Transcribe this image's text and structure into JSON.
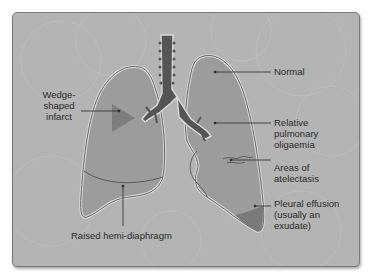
{
  "figure": {
    "colors": {
      "background": "#b4b4b4",
      "lung_fill": "#9c9c9c",
      "lung_outline": "#5a5a5a",
      "lung_halo": "#d8d8d8",
      "airway": "#555555",
      "infarct": "#7e7e7e",
      "effusion": "#7a7a7a",
      "leader_line": "#2a2a2a",
      "text": "#2a2a2a"
    }
  },
  "labels": {
    "wedge": "Wedge-\nshaped\ninfarct",
    "normal": "Normal",
    "oligaemia": "Relative\npulmonary\noligaemia",
    "atelectasis": "Areas of\natelectasis",
    "effusion": "Pleural effusion\n(usually an\nexudate)",
    "diaphragm": "Raised hemi-diaphragm"
  }
}
